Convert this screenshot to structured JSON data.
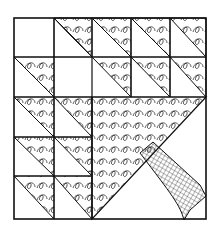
{
  "figure": {
    "grid": {
      "cols": 5,
      "rows": 5
    },
    "colors": {
      "stroke": "#111111",
      "background": "#ffffff"
    },
    "half_square_triangles": [
      {
        "r": 0,
        "c": 1
      },
      {
        "r": 0,
        "c": 2
      },
      {
        "r": 0,
        "c": 3
      },
      {
        "r": 0,
        "c": 4
      },
      {
        "r": 1,
        "c": 0
      },
      {
        "r": 1,
        "c": 2
      },
      {
        "r": 1,
        "c": 3
      },
      {
        "r": 1,
        "c": 4
      },
      {
        "r": 2,
        "c": 0
      },
      {
        "r": 2,
        "c": 1
      },
      {
        "r": 3,
        "c": 0
      },
      {
        "r": 3,
        "c": 1
      },
      {
        "r": 4,
        "c": 0
      },
      {
        "r": 4,
        "c": 1
      }
    ],
    "elements": [
      "outer-border",
      "grid-lines",
      "half-square-triangles",
      "large-tree-triangle",
      "crosshatched-trunk"
    ]
  }
}
